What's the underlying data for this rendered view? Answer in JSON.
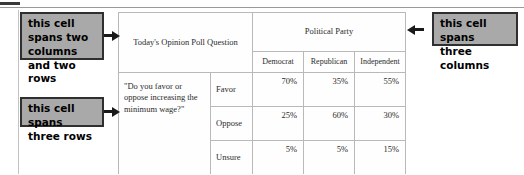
{
  "table": {
    "question_header": "Today's Opinion Poll Question",
    "party_header": "Political Party",
    "party_columns": [
      "Democrat",
      "Republican",
      "Independent"
    ],
    "question_text": "\"Do you favor or oppose increasing the minimum wage?\"",
    "rows": [
      {
        "response": "Favor",
        "values": [
          "70%",
          "35%",
          "55%"
        ]
      },
      {
        "response": "Oppose",
        "values": [
          "25%",
          "60%",
          "30%"
        ]
      },
      {
        "response": "Unsure",
        "values": [
          "5%",
          "5%",
          "15%"
        ]
      }
    ]
  },
  "annotations": {
    "two_col_two_row": "this cell spans two columns and two rows",
    "three_rows": "this cell spans three rows",
    "three_cols": "this cell spans three columns"
  },
  "colors": {
    "callout_fill": "#a9a9a9",
    "callout_border": "#2f2f2f",
    "table_border": "#b9b9b9",
    "text": "#2b2b2b"
  }
}
